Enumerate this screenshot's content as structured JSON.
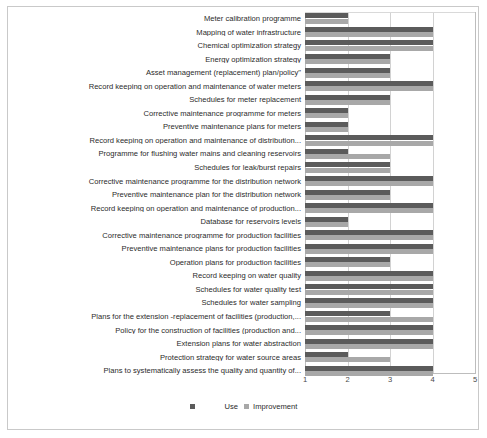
{
  "chart_data": {
    "type": "bar",
    "orientation": "horizontal",
    "title": "",
    "xlabel": "",
    "ylabel": "",
    "xlim": [
      1,
      5
    ],
    "xticks": [
      1,
      2,
      3,
      4,
      5
    ],
    "grid": true,
    "legend_position": "bottom",
    "colors": {
      "use": "#5b5b5b",
      "improvement": "#a8a8a8",
      "gridline": "#d2d2d2",
      "axis": "#bdbdbd",
      "text": "#2b2b2b",
      "background": "#ffffff",
      "page_border": "#c9c9c9"
    },
    "categories": [
      "Meter calibration programme",
      "Mapping of water infrastructure",
      "Chemical optimization strategy",
      "Energy optimization strategy",
      "Asset management (replacement) plan/policy\"",
      "Record keeping on operation and maintenance of water meters",
      "Schedules for meter replacement",
      "Corrective maintenance programme for meters",
      "Preventive maintenance plans for meters",
      "Record keeping on operation and maintenance of distribution...",
      "Programme for flushing water mains and cleaning reservoirs",
      "Schedules for leak/burst repairs",
      "Corrective maintenance programme for the distribution network",
      "Preventive  maintenance plan for the distribution network",
      "Record keeping on operation and maintenance of production...",
      "Database for reservoirs levels",
      "Corrective maintenance programme for  production facilities",
      "Preventive maintenance plans for production facilities",
      "Operation plans for production facilities",
      "Record keeping on water quality",
      "Schedules for water quality test",
      "Schedules for water sampling",
      "Plans for the extension -replacement of facilities (production,...",
      "Policy for the construction of facilities (production and...",
      "Extension plans for water abstraction",
      "Protection strategy for water source areas",
      "Plans to systematically assess the  quality and quantity of..."
    ],
    "series": [
      {
        "name": "Use",
        "color": "#5b5b5b",
        "values": [
          2,
          4,
          4,
          3,
          3,
          4,
          3,
          2,
          2,
          4,
          2,
          3,
          4,
          3,
          4,
          2,
          4,
          4,
          3,
          4,
          4,
          4,
          3,
          4,
          4,
          2,
          4
        ]
      },
      {
        "name": "Improvement",
        "color": "#a8a8a8",
        "values": [
          2,
          4,
          4,
          3,
          3,
          4,
          3,
          2,
          2,
          4,
          3,
          3,
          4,
          3,
          4,
          2,
          4,
          4,
          3,
          4,
          4,
          4,
          4,
          4,
          4,
          3,
          4
        ]
      }
    ]
  },
  "legend": {
    "use_label": "Use",
    "improvement_label": "Improvement"
  }
}
